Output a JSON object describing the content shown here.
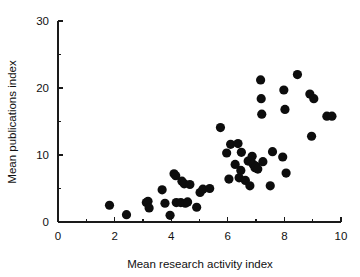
{
  "chart_data": {
    "type": "scatter",
    "title": "",
    "xlabel": "Mean research activity index",
    "ylabel": "Mean publications index",
    "xlim": [
      0,
      10
    ],
    "ylim": [
      0,
      30
    ],
    "grid": false,
    "legend": null,
    "x_ticks_major": [
      0,
      2,
      4,
      6,
      8,
      10
    ],
    "x_ticks_minor": [
      1,
      3,
      5,
      7,
      9
    ],
    "y_ticks_major": [
      0,
      10,
      20,
      30
    ],
    "y_ticks_minor": [
      5,
      15,
      25
    ],
    "x_tick_labels": [
      "0",
      "2",
      "4",
      "6",
      "8",
      "10"
    ],
    "y_tick_labels": [
      "0",
      "10",
      "20",
      "30"
    ],
    "marker": "filled-circle",
    "marker_color": "#0d0d0d",
    "marker_size": 4.6,
    "n_points": 56,
    "points": [
      {
        "x": 1.82,
        "y": 2.5
      },
      {
        "x": 2.42,
        "y": 1.1
      },
      {
        "x": 3.12,
        "y": 2.9
      },
      {
        "x": 3.18,
        "y": 3.1
      },
      {
        "x": 3.22,
        "y": 2.1
      },
      {
        "x": 3.68,
        "y": 4.8
      },
      {
        "x": 3.78,
        "y": 2.8
      },
      {
        "x": 3.96,
        "y": 1.0
      },
      {
        "x": 4.1,
        "y": 7.2
      },
      {
        "x": 4.16,
        "y": 6.9
      },
      {
        "x": 4.18,
        "y": 2.9
      },
      {
        "x": 4.34,
        "y": 2.9
      },
      {
        "x": 4.38,
        "y": 6.1
      },
      {
        "x": 4.46,
        "y": 5.7
      },
      {
        "x": 4.5,
        "y": 2.8
      },
      {
        "x": 4.58,
        "y": 3.0
      },
      {
        "x": 4.66,
        "y": 5.6
      },
      {
        "x": 4.9,
        "y": 2.2
      },
      {
        "x": 5.02,
        "y": 4.4
      },
      {
        "x": 5.12,
        "y": 4.9
      },
      {
        "x": 5.36,
        "y": 5.0
      },
      {
        "x": 5.74,
        "y": 14.1
      },
      {
        "x": 5.96,
        "y": 10.3
      },
      {
        "x": 6.04,
        "y": 6.4
      },
      {
        "x": 6.1,
        "y": 11.6
      },
      {
        "x": 6.26,
        "y": 8.6
      },
      {
        "x": 6.36,
        "y": 11.7
      },
      {
        "x": 6.4,
        "y": 6.6
      },
      {
        "x": 6.46,
        "y": 7.7
      },
      {
        "x": 6.48,
        "y": 10.4
      },
      {
        "x": 6.62,
        "y": 6.2
      },
      {
        "x": 6.72,
        "y": 9.1
      },
      {
        "x": 6.78,
        "y": 5.4
      },
      {
        "x": 6.86,
        "y": 9.8
      },
      {
        "x": 6.9,
        "y": 8.6
      },
      {
        "x": 6.96,
        "y": 8.1
      },
      {
        "x": 7.0,
        "y": 8.3
      },
      {
        "x": 7.06,
        "y": 7.9
      },
      {
        "x": 7.16,
        "y": 21.2
      },
      {
        "x": 7.18,
        "y": 18.4
      },
      {
        "x": 7.2,
        "y": 16.1
      },
      {
        "x": 7.24,
        "y": 9.0
      },
      {
        "x": 7.5,
        "y": 5.4
      },
      {
        "x": 7.58,
        "y": 10.5
      },
      {
        "x": 7.94,
        "y": 9.7
      },
      {
        "x": 7.98,
        "y": 19.7
      },
      {
        "x": 8.02,
        "y": 16.8
      },
      {
        "x": 8.06,
        "y": 7.3
      },
      {
        "x": 8.46,
        "y": 22.0
      },
      {
        "x": 8.9,
        "y": 19.1
      },
      {
        "x": 8.96,
        "y": 12.8
      },
      {
        "x": 9.04,
        "y": 18.4
      },
      {
        "x": 9.5,
        "y": 15.8
      },
      {
        "x": 9.68,
        "y": 15.8
      }
    ]
  },
  "layout": {
    "plot_left_px": 58,
    "plot_right_px": 341,
    "plot_bottom_px": 222,
    "plot_top_px": 21
  }
}
